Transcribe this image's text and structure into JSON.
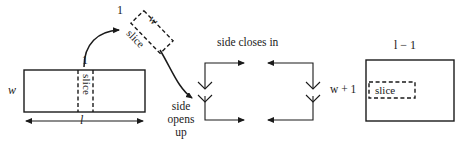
{
  "figure": {
    "type": "diagram",
    "colors": {
      "ink": "#1a1a1a",
      "background": "#ffffff"
    }
  },
  "source_rect": {
    "name": "original-rectangle",
    "width_label": "w",
    "length_label": "l",
    "slice_width_label": "1",
    "slice_label": "slice"
  },
  "extracted_slice": {
    "name": "tilted-slice",
    "short_side_label": "1",
    "long_side_label": "w",
    "body_label": "slice"
  },
  "middle": {
    "side_opens_label_line1": "side",
    "side_opens_label_line2": "opens",
    "side_opens_label_line3": "up",
    "side_closes_label": "side closes in"
  },
  "result_rect": {
    "name": "result-rectangle",
    "top_label": "l − 1",
    "left_label": "w + 1",
    "slice_label": "slice"
  }
}
